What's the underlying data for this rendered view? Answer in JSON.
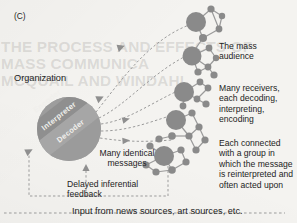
{
  "figure": {
    "panel_letter": "(C)",
    "background_color": "#f4f3f0",
    "node_color": "#8a8a8a",
    "node_edge_color": "#9a9a9a",
    "arrow_color": "#9b9b9b",
    "text_color": "#232323",
    "bleed_through_text": "THE PROCESS AND EFFECTS OF MASS COMMUNICA\nMCQUAIL AND WINDAHL"
  },
  "organization": {
    "label": "Organization",
    "bands": [
      {
        "name": "Encoder",
        "fill": "#9d9d9d"
      },
      {
        "name": "Interpreter",
        "fill": "#8f8f8f"
      },
      {
        "name": "Decoder",
        "fill": "#a6a6a6"
      }
    ],
    "circle": {
      "cx": 69,
      "cy": 129,
      "r": 32,
      "fill": "#a3a3a3"
    }
  },
  "labels": {
    "mass_audience": "The mass\naudience",
    "many_receivers": "Many receivers,\neach decoding,\ninterpreting,\nencoding",
    "each_connected": "Each connected\nwith a group in\nwhich the message\nis reinterpreted and\noften acted upon",
    "many_identical_messages": "Many identical\nmessages",
    "delayed_inferential_feedback": "Delayed inferential\nfeedback",
    "input_sources": "Input from news sources, art sources, etc."
  },
  "message_arrows": [
    {
      "id": "msg-1",
      "d": "M 96 112 C 120 82 150 38 192 24",
      "arrow_at": 0.42
    },
    {
      "id": "msg-2",
      "d": "M 99 118 C 128 104 152 72 190 54",
      "arrow_at": 0.46
    },
    {
      "id": "msg-3",
      "d": "M 101 124 C 130 120 152 102 184 88",
      "arrow_at": 0.55
    },
    {
      "id": "msg-4",
      "d": "M 101 131 C 128 131 150 122 176 114",
      "arrow_at": 0.58
    },
    {
      "id": "msg-5",
      "d": "M 100 138 C 126 142 146 142 172 140",
      "arrow_at": 0.6
    }
  ],
  "feedback": {
    "id": "delayed-inferential-feedback-path",
    "box_d": "M 168 166 L 168 196 L 29 196 L 29 150",
    "riser_d": "M 86 196 L 86 166",
    "arrow_left_at": {
      "x": 29,
      "y": 150
    },
    "arrow_up_at": {
      "x": 86,
      "y": 166
    }
  },
  "input_line": {
    "id": "input-from-sources-line",
    "d": "M 4 213 L 285 213"
  },
  "clusters": [
    {
      "id": "cluster-1",
      "hub": {
        "cx": 196,
        "cy": 22,
        "r": 10
      },
      "nodes": [
        {
          "cx": 211,
          "cy": 9,
          "r": 3.6
        },
        {
          "cx": 222,
          "cy": 16,
          "r": 3.2
        },
        {
          "cx": 219,
          "cy": 29,
          "r": 3.4
        },
        {
          "cx": 203,
          "cy": 38,
          "r": 4.0
        },
        {
          "cx": 196,
          "cy": 48,
          "r": 4.4
        }
      ],
      "edges": [
        [
          0,
          1
        ],
        [
          1,
          2
        ],
        [
          2,
          3
        ],
        [
          3,
          4
        ],
        [
          4,
          5
        ],
        [
          1,
          3
        ]
      ]
    },
    {
      "id": "cluster-2",
      "hub": {
        "cx": 192,
        "cy": 56,
        "r": 9.5
      },
      "nodes": [
        {
          "cx": 209,
          "cy": 48,
          "r": 3.4
        },
        {
          "cx": 216,
          "cy": 58,
          "r": 3.2
        },
        {
          "cx": 208,
          "cy": 67,
          "r": 3.4
        },
        {
          "cx": 198,
          "cy": 72,
          "r": 3.6
        },
        {
          "cx": 214,
          "cy": 75,
          "r": 3.6
        }
      ],
      "edges": [
        [
          0,
          1
        ],
        [
          1,
          2
        ],
        [
          2,
          3
        ],
        [
          0,
          3
        ],
        [
          3,
          4
        ],
        [
          4,
          5
        ],
        [
          0,
          2
        ]
      ]
    },
    {
      "id": "cluster-3",
      "hub": {
        "cx": 184,
        "cy": 92,
        "r": 10
      },
      "nodes": [
        {
          "cx": 200,
          "cy": 82,
          "r": 3.4
        },
        {
          "cx": 208,
          "cy": 88,
          "r": 3.4
        },
        {
          "cx": 197,
          "cy": 99,
          "r": 3.4
        },
        {
          "cx": 206,
          "cy": 104,
          "r": 3.6
        },
        {
          "cx": 183,
          "cy": 106,
          "r": 3.4
        }
      ],
      "edges": [
        [
          0,
          1
        ],
        [
          1,
          2
        ],
        [
          0,
          3
        ],
        [
          3,
          4
        ],
        [
          0,
          5
        ],
        [
          2,
          3
        ]
      ]
    },
    {
      "id": "cluster-4",
      "hub": {
        "cx": 176,
        "cy": 120,
        "r": 10
      },
      "nodes": [
        {
          "cx": 192,
          "cy": 113,
          "r": 3.6
        },
        {
          "cx": 199,
          "cy": 127,
          "r": 3.6
        },
        {
          "cx": 189,
          "cy": 136,
          "r": 3.6
        },
        {
          "cx": 172,
          "cy": 136,
          "r": 3.8
        },
        {
          "cx": 159,
          "cy": 139,
          "r": 3.6
        },
        {
          "cx": 205,
          "cy": 140,
          "r": 3.6
        },
        {
          "cx": 196,
          "cy": 150,
          "r": 3.6
        }
      ],
      "edges": [
        [
          0,
          1
        ],
        [
          1,
          2
        ],
        [
          2,
          3
        ],
        [
          0,
          3
        ],
        [
          3,
          4
        ],
        [
          4,
          5
        ],
        [
          2,
          6
        ],
        [
          6,
          7
        ],
        [
          5,
          7
        ]
      ]
    },
    {
      "id": "cluster-5",
      "hub": {
        "cx": 164,
        "cy": 156,
        "r": 10
      },
      "nodes": [
        {
          "cx": 150,
          "cy": 146,
          "r": 3.6
        },
        {
          "cx": 181,
          "cy": 150,
          "r": 3.6
        },
        {
          "cx": 186,
          "cy": 162,
          "r": 3.6
        },
        {
          "cx": 172,
          "cy": 170,
          "r": 3.8
        },
        {
          "cx": 156,
          "cy": 172,
          "r": 3.6
        },
        {
          "cx": 146,
          "cy": 165,
          "r": 3.6
        }
      ],
      "edges": [
        [
          0,
          1
        ],
        [
          0,
          2
        ],
        [
          2,
          3
        ],
        [
          3,
          4
        ],
        [
          0,
          4
        ],
        [
          4,
          5
        ],
        [
          0,
          6
        ],
        [
          5,
          6
        ]
      ]
    }
  ]
}
